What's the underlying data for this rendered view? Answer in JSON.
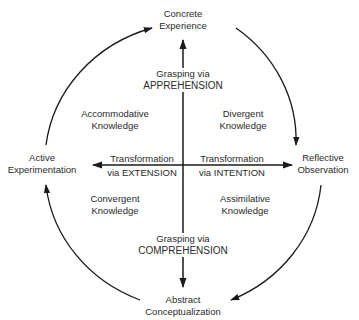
{
  "diagram": {
    "colors": {
      "line": "#1a1a1a",
      "text": "#2a2a2a",
      "background": "#ffffff"
    },
    "poles": {
      "top": {
        "line1": "Concrete",
        "line2": "Experience"
      },
      "right": {
        "line1": "Reflective",
        "line2": "Observation"
      },
      "bottom": {
        "line1": "Abstract",
        "line2": "Conceptualization"
      },
      "left": {
        "line1": "Active",
        "line2": "Experimentation"
      }
    },
    "axes": {
      "vertical_top": {
        "line1": "Grasping via",
        "line2": "APPREHENSION"
      },
      "vertical_bottom": {
        "line1": "Grasping via",
        "line2": "COMPREHENSION"
      },
      "horizontal_left": {
        "line1": "Transformation",
        "line2": "via EXTENSION"
      },
      "horizontal_right": {
        "line1": "Transformation",
        "line2": "via INTENTION"
      }
    },
    "quadrants": {
      "top_left": {
        "line1": "Accommodative",
        "line2": "Knowledge"
      },
      "top_right": {
        "line1": "Divergent",
        "line2": "Knowledge"
      },
      "bottom_left": {
        "line1": "Convergent",
        "line2": "Knowledge"
      },
      "bottom_right": {
        "line1": "Assimilative",
        "line2": "Knowledge"
      }
    },
    "cycle_direction": "clockwise"
  }
}
